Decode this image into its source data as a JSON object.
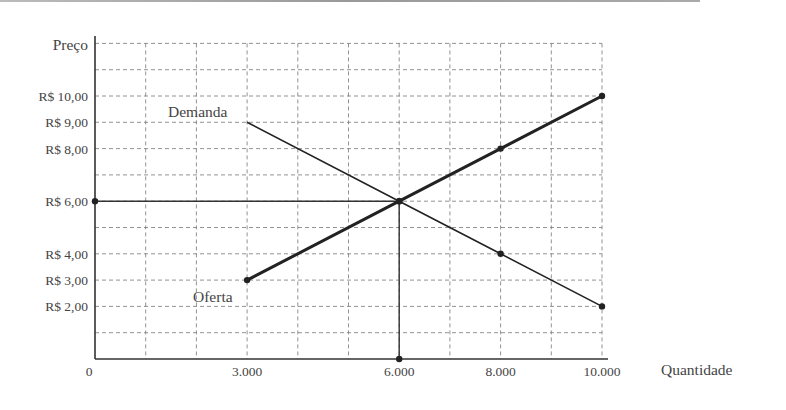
{
  "chart_data": {
    "type": "line",
    "title": "",
    "xlabel": "Quantidade",
    "ylabel": "Preço",
    "xlim": [
      0,
      10000
    ],
    "ylim": [
      0,
      12
    ],
    "grid": true,
    "x_ticks": [
      {
        "value": 0,
        "label": "0"
      },
      {
        "value": 3000,
        "label": "3.000"
      },
      {
        "value": 6000,
        "label": "6.000"
      },
      {
        "value": 8000,
        "label": "8.000"
      },
      {
        "value": 10000,
        "label": "10.000"
      }
    ],
    "y_ticks": [
      {
        "value": 10,
        "label": "R$ 10,00"
      },
      {
        "value": 9,
        "label": "R$ 9,00"
      },
      {
        "value": 8,
        "label": "R$ 8,00"
      },
      {
        "value": 6,
        "label": "R$ 6,00"
      },
      {
        "value": 4,
        "label": "R$ 4,00"
      },
      {
        "value": 3,
        "label": "R$ 3,00"
      },
      {
        "value": 2,
        "label": "R$ 2,00"
      }
    ],
    "series": [
      {
        "name": "Demanda",
        "x": [
          3000,
          6000,
          8000,
          10000
        ],
        "y": [
          9,
          6,
          4,
          2
        ],
        "markers": [
          6000,
          8000,
          10000
        ],
        "stroke_width": 1.6
      },
      {
        "name": "Oferta",
        "x": [
          3000,
          6000,
          8000,
          10000
        ],
        "y": [
          3,
          6,
          8,
          10
        ],
        "markers": [
          3000,
          6000,
          8000,
          10000
        ],
        "stroke_width": 3
      }
    ],
    "annotations": [
      {
        "type": "equilibrium",
        "x": 6000,
        "y": 6
      },
      {
        "type": "guide_h",
        "from": [
          0,
          6
        ],
        "to": [
          6000,
          6
        ]
      },
      {
        "type": "guide_v",
        "from": [
          6000,
          6
        ],
        "to": [
          6000,
          0
        ]
      }
    ]
  },
  "labels": {
    "ylabel": "Preço",
    "xlabel": "Quantidade",
    "demand": "Demanda",
    "supply": "Oferta"
  }
}
